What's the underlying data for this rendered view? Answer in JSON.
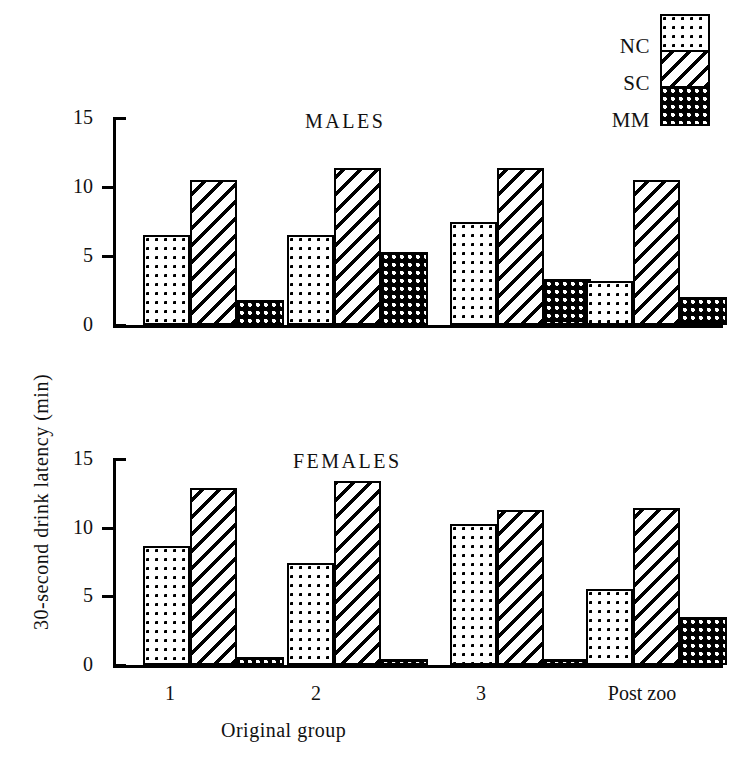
{
  "figure": {
    "y_axis_title": "30-second drink latency  (min)",
    "x_axis_title": "Original group"
  },
  "legend": {
    "items": [
      {
        "label": "NC",
        "pattern": "light-dots"
      },
      {
        "label": "SC",
        "pattern": "diagonal-hatch"
      },
      {
        "label": "MM",
        "pattern": "dense-dots-dark"
      }
    ]
  },
  "panels": [
    {
      "title": "MALES"
    },
    {
      "title": "FEMALES"
    }
  ],
  "axis": {
    "ticks": [
      "15",
      "10",
      "5",
      "0"
    ],
    "tick_values": [
      15,
      10,
      5,
      0
    ]
  },
  "categories": [
    "1",
    "2",
    "3",
    "Post zoo"
  ],
  "chart_data": [
    {
      "type": "bar",
      "title": "MALES",
      "categories": [
        "1",
        "2",
        "3",
        "Post zoo"
      ],
      "series": [
        {
          "name": "NC",
          "values": [
            6.5,
            6.5,
            7.5,
            3.2
          ]
        },
        {
          "name": "SC",
          "values": [
            10.5,
            11.4,
            11.4,
            10.5
          ]
        },
        {
          "name": "MM",
          "values": [
            1.8,
            5.3,
            3.3,
            2.0
          ]
        }
      ],
      "xlabel": "Original group",
      "ylabel": "30-second drink latency  (min)",
      "ylim": [
        0,
        15
      ],
      "yticks": [
        0,
        5,
        10,
        15
      ],
      "grid": false,
      "legend_position": "top-right"
    },
    {
      "type": "bar",
      "title": "FEMALES",
      "categories": [
        "1",
        "2",
        "3",
        "Post zoo"
      ],
      "series": [
        {
          "name": "NC",
          "values": [
            8.7,
            7.4,
            10.3,
            5.5
          ]
        },
        {
          "name": "SC",
          "values": [
            12.9,
            13.4,
            11.3,
            11.4
          ]
        },
        {
          "name": "MM",
          "values": [
            0.6,
            0.45,
            0.45,
            3.5
          ]
        }
      ],
      "xlabel": "Original group",
      "ylabel": "30-second drink latency  (min)",
      "ylim": [
        0,
        15
      ],
      "yticks": [
        0,
        5,
        10,
        15
      ],
      "grid": false,
      "legend_position": "top-right"
    }
  ]
}
